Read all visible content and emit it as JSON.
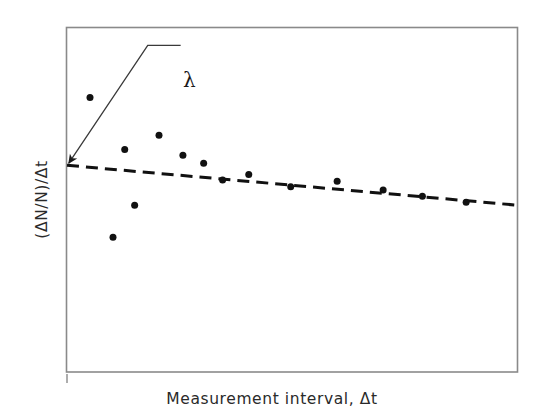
{
  "figure": {
    "background_color": "#ffffff",
    "frame_color": "#8a8a8a",
    "ink_color": "#1a1a1a",
    "lambda_label": "λ",
    "origin_tick": "origin-tick"
  },
  "chart_data": {
    "type": "scatter",
    "title": "",
    "subtitle": "",
    "xlabel": "Measurement interval, Δt",
    "ylabel": "(ΔN/N)/Δt",
    "xlim": [
      0,
      100
    ],
    "ylim": [
      0,
      100
    ],
    "grid": false,
    "legend": null,
    "xticklabels": [],
    "yticklabels": [],
    "series": [
      {
        "name": "Measured points",
        "type": "scatter",
        "marker": "filled-circle",
        "marker_color": "#111111",
        "marker_size_px": 7,
        "points": [
          {
            "x": 5.1,
            "y": 79.7
          },
          {
            "x": 12.8,
            "y": 64.6
          },
          {
            "x": 15.0,
            "y": 48.4
          },
          {
            "x": 20.4,
            "y": 68.7
          },
          {
            "x": 10.2,
            "y": 39.1
          },
          {
            "x": 25.7,
            "y": 62.9
          },
          {
            "x": 30.3,
            "y": 60.6
          },
          {
            "x": 34.5,
            "y": 55.7
          },
          {
            "x": 40.3,
            "y": 57.3
          },
          {
            "x": 49.6,
            "y": 53.8
          },
          {
            "x": 59.9,
            "y": 55.4
          },
          {
            "x": 70.1,
            "y": 52.8
          },
          {
            "x": 78.8,
            "y": 51.0
          },
          {
            "x": 88.5,
            "y": 49.3
          }
        ]
      },
      {
        "name": "Trend line (λ asymptote)",
        "type": "line",
        "style": "dashed",
        "color": "#111111",
        "width_px": 3,
        "dash_px": [
          12,
          7
        ],
        "points": [
          {
            "x": 0.0,
            "y": 60.0
          },
          {
            "x": 100.0,
            "y": 48.4
          }
        ]
      }
    ],
    "annotations": [
      {
        "name": "lambda-annotation",
        "text": "λ",
        "text_x": 27.0,
        "text_y": 89.0,
        "arrow_tip_x": 0.4,
        "arrow_tip_y": 60.6,
        "leader_elbow_x": 17.9,
        "leader_elbow_y": 94.8,
        "leader_end_x": 25.2,
        "leader_end_y": 94.8,
        "description": "Arrow pointing to the y-intercept of the dashed asymptote, labelled lambda (the decay constant)."
      }
    ]
  }
}
